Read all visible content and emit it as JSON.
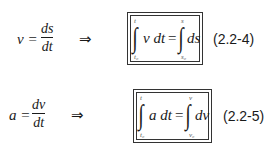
{
  "equations": [
    {
      "definition": {
        "lhs": "v =",
        "numerator": "ds",
        "denominator": "dt"
      },
      "implies": "⇒",
      "boxed": {
        "left_integrand": "v dt",
        "left_upper": "t",
        "left_lower": "t₀",
        "equals": "=",
        "right_integrand": "ds",
        "right_upper": "s",
        "right_lower": "s₀"
      },
      "label": "(2.2-4)"
    },
    {
      "definition": {
        "lhs": "a =",
        "numerator": "dv",
        "denominator": "dt"
      },
      "implies": "⇒",
      "boxed": {
        "left_integrand": "a dt",
        "left_upper": "t",
        "left_lower": "t₀",
        "equals": "=",
        "right_integrand": "dv",
        "right_upper": "v",
        "right_lower": "v₀"
      },
      "label": "(2.2-5)"
    }
  ],
  "integral_symbol": "∫"
}
